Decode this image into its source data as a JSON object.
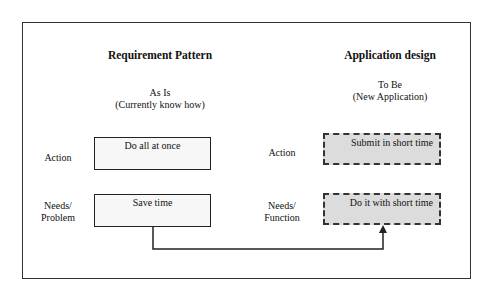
{
  "left_column": {
    "title": "Requirement Pattern",
    "subtitle_line1": "As Is",
    "subtitle_line2": "(Currently know how)",
    "rows": [
      {
        "label_line1": "Action",
        "label_line2": "",
        "box_text": "Do all at once"
      },
      {
        "label_line1": "Needs/",
        "label_line2": "Problem",
        "box_text": "Save time"
      }
    ]
  },
  "right_column": {
    "title": "Application design",
    "subtitle_line1": "To Be",
    "subtitle_line2": "(New Application)",
    "rows": [
      {
        "label_line1": "Action",
        "label_line2": "",
        "box_text": "Submit in short time"
      },
      {
        "label_line1": "Needs/",
        "label_line2": "Function",
        "box_text": "Do it with short time"
      }
    ]
  },
  "connector": {
    "from": "Save time",
    "to": "Do it with short time",
    "style": "elbow-arrow"
  }
}
